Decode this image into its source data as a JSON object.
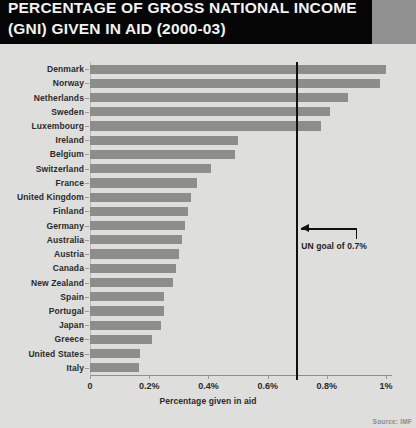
{
  "header": {
    "title": "PERCENTAGE OF GROSS NATIONAL INCOME\n(GNI) GIVEN IN AID (2000-03)",
    "banner_color": "#050505",
    "accent_block_color": "#919191"
  },
  "footer": {
    "source": "Source: IMF"
  },
  "annotation": {
    "goal_label": "UN goal of 0.7%",
    "goal_value": 0.7
  },
  "chart_data": {
    "type": "bar",
    "orientation": "horizontal",
    "title": "PERCENTAGE OF GROSS NATIONAL INCOME (GNI) GIVEN IN AID (2000-03)",
    "xlabel": "Percentage given in aid",
    "ylabel": "",
    "xlim": [
      0,
      1.02
    ],
    "grid": false,
    "legend": "none",
    "bar_color": "#8d8d8b",
    "background_color": "#dededc",
    "xticks": [
      0,
      0.2,
      0.4,
      0.6,
      0.8,
      1
    ],
    "xtick_labels": [
      "0",
      "0.2%",
      "0.4%",
      "0.6%",
      "0.8%",
      "1%"
    ],
    "categories": [
      "Denmark",
      "Norway",
      "Netherlands",
      "Sweden",
      "Luxembourg",
      "Ireland",
      "Belgium",
      "Switzerland",
      "France",
      "United Kingdom",
      "Finland",
      "Germany",
      "Australia",
      "Austria",
      "Canada",
      "New Zealand",
      "Spain",
      "Portugal",
      "Japan",
      "Greece",
      "United States",
      "Italy"
    ],
    "values": [
      1.0,
      0.98,
      0.87,
      0.81,
      0.78,
      0.5,
      0.49,
      0.41,
      0.36,
      0.34,
      0.33,
      0.32,
      0.31,
      0.3,
      0.29,
      0.28,
      0.25,
      0.25,
      0.24,
      0.21,
      0.17,
      0.165
    ],
    "annotations": [
      {
        "label": "UN goal of 0.7%",
        "x": 0.7,
        "type": "vline"
      }
    ]
  }
}
